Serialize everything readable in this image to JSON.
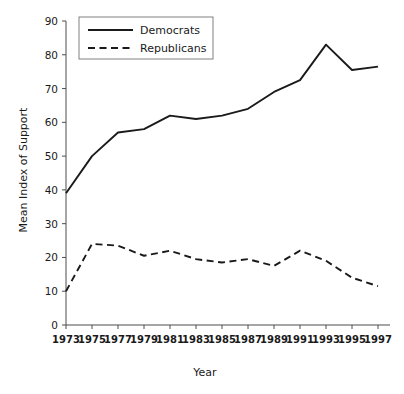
{
  "chart_data": {
    "type": "line",
    "title": "",
    "xlabel": "Year",
    "ylabel": "Mean Index of Support",
    "x": [
      1973,
      1975,
      1977,
      1979,
      1981,
      1983,
      1985,
      1987,
      1989,
      1991,
      1993,
      1995,
      1997
    ],
    "xtick_labels": [
      "1973",
      "1975",
      "1977",
      "1979",
      "1981",
      "1983",
      "1985",
      "1987",
      "1989",
      "1991",
      "1993",
      "1995",
      "1997"
    ],
    "ytick_labels": [
      "0",
      "10",
      "20",
      "30",
      "40",
      "50",
      "60",
      "70",
      "80",
      "90"
    ],
    "yticks": [
      0,
      10,
      20,
      30,
      40,
      50,
      60,
      70,
      80,
      90
    ],
    "xlim": [
      1973,
      1997
    ],
    "ylim": [
      0,
      90
    ],
    "grid": false,
    "legend_position": "top-left",
    "series": [
      {
        "name": "Democrats",
        "style": "solid",
        "color": "#1a1a1a",
        "values": [
          39,
          50,
          57,
          58,
          62,
          61,
          62,
          64,
          69,
          72.5,
          83,
          75.5,
          76.5
        ]
      },
      {
        "name": "Republicans",
        "style": "dashed",
        "color": "#1a1a1a",
        "values": [
          10,
          24,
          23.5,
          20.5,
          22,
          19.5,
          18.5,
          19.5,
          17.5,
          22,
          19,
          14,
          11.5
        ]
      }
    ]
  },
  "legend": {
    "entries": [
      {
        "label": "Democrats"
      },
      {
        "label": "Republicans"
      }
    ]
  },
  "axes": {
    "x_title": "Year",
    "y_title": "Mean Index of Support"
  }
}
